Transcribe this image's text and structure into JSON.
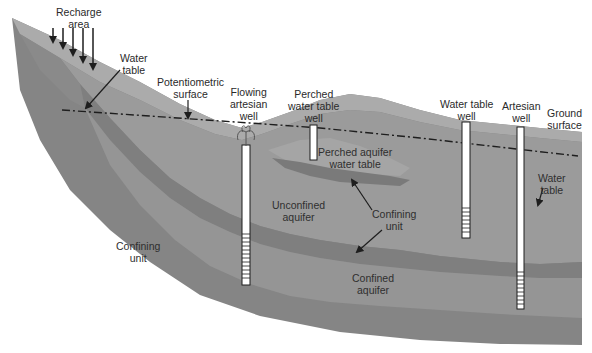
{
  "diagram": {
    "type": "cross-section",
    "colors": {
      "background": "#ffffff",
      "surface_soil": "#a9a9a9",
      "upper_slope": "#8f8f8f",
      "unconfined_aquifer": "#9a9a9a",
      "perched_aquifer": "#a3a3a3",
      "confining_unit": "#7e7e7e",
      "confined_aquifer": "#939393",
      "deep_confining_unit": "#858585",
      "well_casing": "#ffffff",
      "line": "#1e1e1e"
    },
    "labels": {
      "recharge_area": [
        "Recharge",
        "area"
      ],
      "water_table_top": [
        "Water",
        "table"
      ],
      "potentiometric_surface": [
        "Potentiometric",
        "surface"
      ],
      "flowing_artesian_well": [
        "Flowing",
        "artesian",
        "well"
      ],
      "perched_water_table_well": [
        "Perched",
        "water table",
        "well"
      ],
      "water_table_well": [
        "Water table",
        "well"
      ],
      "artesian_well": [
        "Artesian",
        "well"
      ],
      "ground_surface": [
        "Ground",
        "surface"
      ],
      "perched_aquifer_water_table": [
        "Perched aquifer",
        "water table"
      ],
      "unconfined_aquifer": [
        "Unconfined",
        "aquifer"
      ],
      "confining_unit_mid": [
        "Confining",
        "unit"
      ],
      "water_table_right": [
        "Water",
        "table"
      ],
      "confining_unit_left": [
        "Confining",
        "unit"
      ],
      "confined_aquifer": [
        "Confined",
        "aquifer"
      ]
    },
    "recharge_arrows": 5,
    "wells": [
      {
        "name": "Flowing artesian well",
        "screen_segments": 12
      },
      {
        "name": "Perched water table well",
        "screen_segments": 0
      },
      {
        "name": "Water table well",
        "screen_segments": 7
      },
      {
        "name": "Artesian well",
        "screen_segments": 10
      }
    ]
  }
}
